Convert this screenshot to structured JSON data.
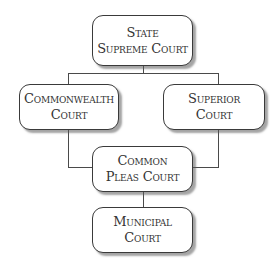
{
  "diagram": {
    "type": "hierarchy",
    "title": "",
    "nodes": [
      {
        "id": "state_supreme",
        "lines": [
          "State",
          "Supreme Court"
        ]
      },
      {
        "id": "commonwealth",
        "lines": [
          "Commonwealth",
          "Court"
        ]
      },
      {
        "id": "superior",
        "lines": [
          "Superior",
          "Court"
        ]
      },
      {
        "id": "common_pleas",
        "lines": [
          "Common",
          "Pleas Court"
        ]
      },
      {
        "id": "municipal",
        "lines": [
          "Municipal",
          "Court"
        ]
      }
    ],
    "edges": [
      {
        "from": "state_supreme",
        "to": "commonwealth"
      },
      {
        "from": "state_supreme",
        "to": "superior"
      },
      {
        "from": "commonwealth",
        "to": "common_pleas"
      },
      {
        "from": "superior",
        "to": "common_pleas"
      },
      {
        "from": "common_pleas",
        "to": "municipal"
      }
    ]
  },
  "colors": {
    "border": "#3a3a3a",
    "text": "#333333",
    "connector": "#4a4a4a",
    "background": "#ffffff"
  }
}
